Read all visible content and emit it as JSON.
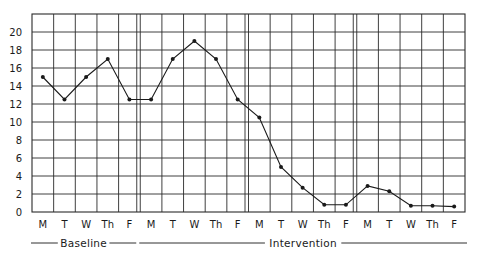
{
  "chart_data": {
    "type": "line",
    "title": "",
    "xlabel": "",
    "ylabel": "",
    "ylim": [
      0,
      22
    ],
    "yticks": [
      0,
      2,
      4,
      6,
      8,
      10,
      12,
      14,
      16,
      18,
      20
    ],
    "grid": true,
    "legend": null,
    "categories": [
      "M",
      "T",
      "W",
      "Th",
      "F",
      "M",
      "T",
      "W",
      "Th",
      "F",
      "M",
      "T",
      "W",
      "Th",
      "F",
      "M",
      "T",
      "W",
      "Th",
      "F"
    ],
    "series": [
      {
        "name": "Behavior frequency",
        "values": [
          15,
          12.5,
          15,
          17,
          12.5,
          12.5,
          17,
          19,
          17,
          12.5,
          10.5,
          5,
          2.7,
          0.8,
          0.8,
          2.9,
          2.3,
          0.7,
          0.7,
          0.6
        ]
      }
    ],
    "week_separators_after_index": [
      4,
      9,
      14
    ],
    "phases": [
      {
        "label": "Baseline",
        "start_index": 0,
        "end_index": 4
      },
      {
        "label": "Intervention",
        "start_index": 5,
        "end_index": 19
      }
    ]
  },
  "colors": {
    "line": "#1a1a1a",
    "grid": "#2a2a2a",
    "background": "#ffffff"
  }
}
